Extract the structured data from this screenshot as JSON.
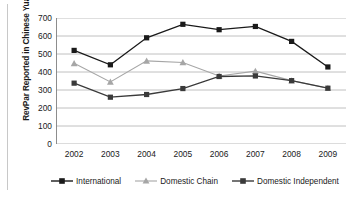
{
  "figure": {
    "title_remnant": "",
    "ylabel": "RevPar Reported in Chinese Yuan"
  },
  "legend": {
    "position": "bottom",
    "items": [
      {
        "label": "International",
        "marker": "filled-square-marker",
        "color": "#1a1a1a"
      },
      {
        "label": "Domestic Chain",
        "marker": "filled-triangle-marker",
        "color": "#a6a6a6"
      },
      {
        "label": "Domestic Independent",
        "marker": "filled-square-marker",
        "color": "#3a3a3a"
      }
    ]
  },
  "axes": {
    "y_ticks": [
      "700",
      "600",
      "500",
      "400",
      "300",
      "200",
      "100",
      "0"
    ],
    "x_ticks": [
      "2002",
      "2003",
      "2004",
      "2005",
      "2006",
      "2007",
      "2008",
      "2009"
    ]
  },
  "chart_data": {
    "type": "line",
    "title": "",
    "xlabel": "",
    "ylabel": "RevPar Reported in Chinese Yuan",
    "categories": [
      "2002",
      "2003",
      "2004",
      "2005",
      "2006",
      "2007",
      "2008",
      "2009"
    ],
    "x": [
      2002,
      2003,
      2004,
      2005,
      2006,
      2007,
      2008,
      2009
    ],
    "ylim": [
      0,
      700
    ],
    "ytick_step": 100,
    "grid": "horizontal",
    "legend_position": "bottom",
    "series": [
      {
        "name": "International",
        "color": "#1a1a1a",
        "marker": "square",
        "values": [
          520,
          440,
          590,
          665,
          635,
          653,
          570,
          428
        ]
      },
      {
        "name": "Domestic Chain",
        "color": "#a6a6a6",
        "marker": "triangle",
        "values": [
          448,
          345,
          462,
          453,
          378,
          405,
          352,
          310
        ]
      },
      {
        "name": "Domestic Independent",
        "color": "#3a3a3a",
        "marker": "square",
        "values": [
          338,
          260,
          275,
          308,
          375,
          378,
          352,
          310
        ]
      }
    ]
  },
  "style": {
    "gridline_color": "#b0b0b0",
    "axis_color": "#808080",
    "background": "#ffffff"
  }
}
